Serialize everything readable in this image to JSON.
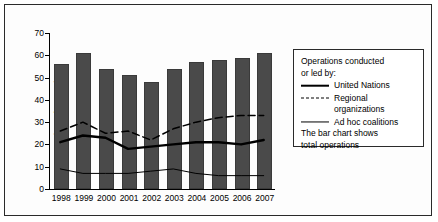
{
  "chart_data": {
    "type": "bar",
    "title": "",
    "xlabel": "",
    "ylabel": "Number of operations",
    "ylim": [
      0,
      70
    ],
    "yticks": [
      0,
      10,
      20,
      30,
      40,
      50,
      60,
      70
    ],
    "grid": false,
    "legend_position": "right",
    "categories": [
      "1998",
      "1999",
      "2000",
      "2001",
      "2002",
      "2003",
      "2004",
      "2005",
      "2006",
      "2007"
    ],
    "values": [
      56,
      61,
      54,
      51,
      48,
      54,
      57,
      58,
      59,
      61
    ],
    "bar_series_name": "Total operations",
    "series": [
      {
        "name": "United Nations",
        "style": "solid-thick",
        "values": [
          21,
          24,
          23,
          18,
          19,
          20,
          21,
          21,
          20,
          22
        ]
      },
      {
        "name": "Regional organizations",
        "style": "dashed",
        "values": [
          26,
          30,
          25,
          26,
          22,
          27,
          30,
          32,
          33,
          33
        ]
      },
      {
        "name": "Ad hoc coalitions",
        "style": "solid-thin",
        "values": [
          9,
          7,
          7,
          7,
          8,
          9,
          7,
          6,
          6,
          6
        ]
      }
    ],
    "annotations": [
      "The bar chart shows total operations"
    ]
  },
  "legend": {
    "heading_line1": "Operations conducted",
    "heading_line2": "or led by:",
    "items": [
      {
        "label": "United Nations"
      },
      {
        "label": "Regional",
        "label_cont": "organizations"
      },
      {
        "label": "Ad hoc coalitions"
      }
    ],
    "note_line1": "The bar chart shows",
    "note_line2": "total operations"
  },
  "colors": {
    "bar_fill": "#4a4a4a",
    "line": "#000000",
    "frame": "#2a2a2a",
    "background": "#ffffff"
  }
}
